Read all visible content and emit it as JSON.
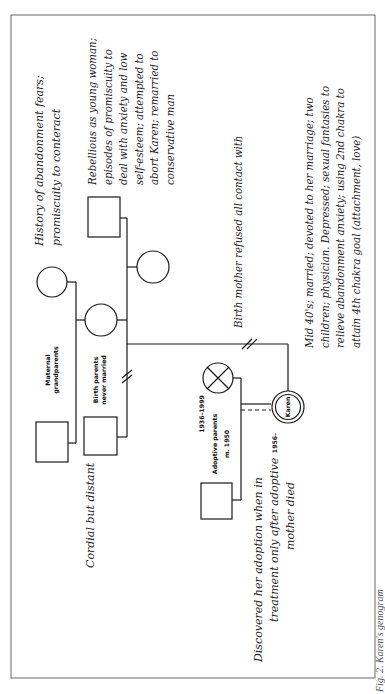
{
  "figure": {
    "caption": "Fig. 2. Karen's genogram"
  },
  "people": {
    "maternal_grandfather": {
      "shape": "square"
    },
    "maternal_grandmother": {
      "shape": "circle"
    },
    "birth_mother": {
      "shape": "circle"
    },
    "birth_father": {
      "shape": "square"
    },
    "stepfather": {
      "shape": "square"
    },
    "sibling_female": {
      "shape": "circle"
    },
    "adoptive_mother": {
      "shape": "circle-x",
      "years": "1936–1999"
    },
    "adoptive_father": {
      "shape": "square"
    },
    "karen": {
      "shape": "double-circle",
      "name": "Karen",
      "years": "1956–"
    }
  },
  "labels": {
    "maternal_grandparents": [
      "Maternal",
      "grandparents"
    ],
    "birth_parents": [
      "Birth parents",
      "never married"
    ],
    "adoptive_parents": "Adoptive parents",
    "adoptive_marriage": "m. 1950"
  },
  "notes": {
    "grandmother": [
      "History of abandonment fears;",
      "promiscuity to conteract"
    ],
    "birth_mother": [
      "Rebellious as young woman;",
      "episodes of promiscuity to",
      "deal with anxiety and low",
      "self-esteem; attempted to",
      "abort Karen; remarried to",
      "conservative man"
    ],
    "birth_father": "Cordial but distant",
    "cutoff": "Birth mother refused all contact with",
    "karen": [
      "Mid 40's; married; devoted to her marriage; two",
      "children; physician. Depressed; sexual fantasies to",
      "relieve abandonment anxiety; using 2nd chakra to",
      "attain 4th chakra goal (attachment, love)"
    ],
    "adoption": [
      "Discovered her adoption when in",
      "treatment only after adoptive",
      "mother died"
    ]
  }
}
